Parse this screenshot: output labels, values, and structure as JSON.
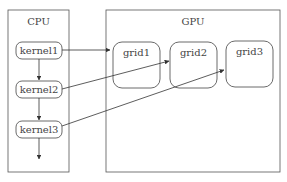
{
  "cpu": {
    "title": "CPU",
    "kernels": [
      {
        "label": "kernel1"
      },
      {
        "label": "kernel2"
      },
      {
        "label": "kernel3"
      }
    ]
  },
  "gpu": {
    "title": "GPU",
    "grids": [
      {
        "label": "grid1"
      },
      {
        "label": "grid2"
      },
      {
        "label": "grid3"
      }
    ]
  },
  "edges": [
    {
      "from": "kernel1",
      "to": "grid1"
    },
    {
      "from": "kernel2",
      "to": "grid2"
    },
    {
      "from": "kernel3",
      "to": "grid3"
    },
    {
      "from": "kernel1",
      "to": "kernel2"
    },
    {
      "from": "kernel2",
      "to": "kernel3"
    },
    {
      "from": "kernel3",
      "to": "continue"
    }
  ],
  "colors": {
    "stroke": "#333333",
    "text": "#444444"
  }
}
